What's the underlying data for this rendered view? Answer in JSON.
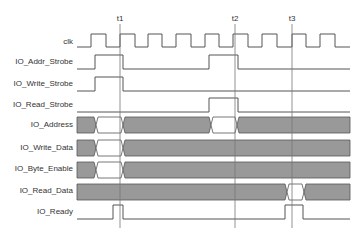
{
  "diagram": {
    "type": "timing-diagram",
    "markers": [
      {
        "label": "t1",
        "x": 120
      },
      {
        "label": "t2",
        "x": 235
      },
      {
        "label": "t3",
        "x": 292
      }
    ],
    "signals": [
      {
        "name": "clk",
        "kind": "clock"
      },
      {
        "name": "IO_Addr_Strobe",
        "kind": "digital"
      },
      {
        "name": "IO_Write_Strobe",
        "kind": "digital"
      },
      {
        "name": "IO_Read_Strobe",
        "kind": "digital"
      },
      {
        "name": "IO_Address",
        "kind": "bus"
      },
      {
        "name": "IO_Write_Data",
        "kind": "bus"
      },
      {
        "name": "IO_Byte_Enable",
        "kind": "bus"
      },
      {
        "name": "IO_Read_Data",
        "kind": "bus"
      },
      {
        "name": "IO_Ready",
        "kind": "digital"
      }
    ],
    "colors": {
      "line": "#555555",
      "bus_fill": "#999999",
      "marker": "#777777"
    }
  }
}
